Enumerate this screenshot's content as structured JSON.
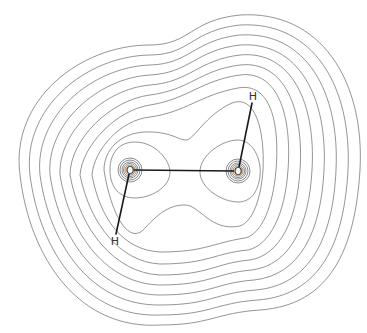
{
  "diagram": {
    "contour_color": "#7a7a7a",
    "bond_color": "#1a1a1a",
    "atoms": [
      {
        "id": "O1",
        "label": "O",
        "x": 130,
        "y": 170
      },
      {
        "id": "O2",
        "label": "O",
        "x": 238,
        "y": 171
      },
      {
        "id": "H1",
        "label": "H",
        "x": 115,
        "y": 240
      },
      {
        "id": "H2",
        "label": "H",
        "x": 253,
        "y": 97
      }
    ],
    "bonds": [
      {
        "from": "O1",
        "to": "O2",
        "type": "hydrogen-bond"
      },
      {
        "from": "O1",
        "to": "H1",
        "type": "covalent"
      },
      {
        "from": "O2",
        "to": "H2",
        "type": "covalent"
      }
    ],
    "outer_contour_count": 10,
    "core_contour_count": 5
  }
}
